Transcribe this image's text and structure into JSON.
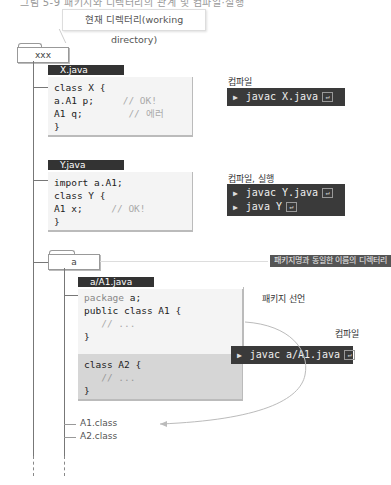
{
  "heading_cut": "그림 5-9 패키지와 디렉터리의 관계 및 컴파일·실행",
  "callout": {
    "working_dir": "현재 디렉터리(working directory)"
  },
  "root_folder": {
    "name": "xxx"
  },
  "x_java": {
    "filename": "X.java",
    "lines": [
      {
        "code": "class X {",
        "comment": ""
      },
      {
        "code": "   a.A1 p;",
        "comment": "// OK!"
      },
      {
        "code": "   A1 q;",
        "comment": "// 에러"
      },
      {
        "code": "}",
        "comment": ""
      }
    ],
    "action_label": "컴파일",
    "commands": [
      "javac X.java"
    ]
  },
  "y_java": {
    "filename": "Y.java",
    "lines": [
      {
        "code": "import a.A1;",
        "comment": ""
      },
      {
        "code": "   class Y {",
        "comment": ""
      },
      {
        "code": "   A1 x;",
        "comment": "// OK!"
      },
      {
        "code": "}",
        "comment": ""
      }
    ],
    "action_label": "컴파일, 실행",
    "commands": [
      "javac Y.java",
      "java Y"
    ]
  },
  "package_folder": {
    "name": "a",
    "banner": "패키지명과 동일한 이름의 디렉터리"
  },
  "a1_java": {
    "filename": "a/A1.java",
    "package_line": {
      "keyword": "package",
      "name": "a;"
    },
    "class_a1": [
      "public class A1 {",
      "   // ...",
      "}"
    ],
    "class_a2": [
      "class A2 {",
      "   // ...",
      "}"
    ],
    "package_decl_label": "패키지 선언",
    "action_label": "컴파일",
    "commands": [
      "javac a/A1.java"
    ]
  },
  "output_files": [
    "A1.class",
    "A2.class"
  ],
  "colors": {
    "terminal_bg": "#3a3a3a",
    "tag_bg": "#333333",
    "code_bg": "#f4f4f4",
    "a2_bg": "#d6d6d6"
  }
}
